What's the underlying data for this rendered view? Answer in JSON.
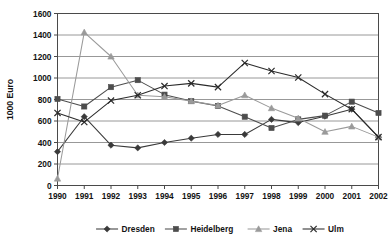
{
  "chart_data": {
    "type": "line",
    "title": "",
    "xlabel": "",
    "ylabel": "1000 Euro",
    "categories": [
      "1990",
      "1991",
      "1992",
      "1993",
      "1994",
      "1995",
      "1996",
      "1997",
      "1998",
      "1999",
      "2000",
      "2001",
      "2002"
    ],
    "ylim": [
      0,
      1600
    ],
    "ytick_step": 200,
    "yticks": [
      "0",
      "200",
      "400",
      "600",
      "800",
      "1000",
      "1200",
      "1400",
      "1600"
    ],
    "grid": "horizontal",
    "legend_position": "bottom",
    "series": [
      {
        "name": "Dresden",
        "marker": "diamond",
        "color": "#3a3a3a",
        "values": [
          315,
          640,
          375,
          350,
          400,
          440,
          475,
          475,
          615,
          585,
          645,
          710,
          450
        ]
      },
      {
        "name": "Heidelberg",
        "marker": "square",
        "color": "#4d4d4d",
        "values": [
          805,
          735,
          915,
          980,
          845,
          785,
          740,
          640,
          535,
          615,
          650,
          780,
          675
        ]
      },
      {
        "name": "Jena",
        "marker": "triangle",
        "color": "#9a9a9a",
        "values": [
          65,
          1425,
          1200,
          840,
          825,
          785,
          745,
          840,
          720,
          625,
          500,
          550,
          450
        ]
      },
      {
        "name": "Ulm",
        "marker": "cross",
        "color": "#2b2b2b",
        "values": [
          675,
          590,
          790,
          840,
          925,
          950,
          915,
          1140,
          1065,
          1005,
          850,
          710,
          450
        ]
      }
    ]
  },
  "colors": {
    "axis": "#4a4a4a",
    "grid": "#8c8c8c",
    "background": "#ffffff",
    "text": "#131313"
  }
}
